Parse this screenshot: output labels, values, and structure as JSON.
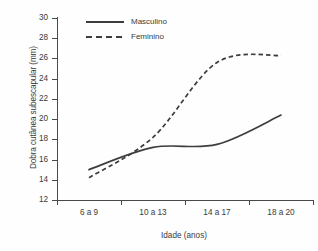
{
  "chart_data": {
    "type": "line",
    "title": "",
    "xlabel": "Idade (anos)",
    "ylabel": "Dobra cutânea subescapular (mm)",
    "categories": [
      "6 a 9",
      "10 a 13",
      "14 a 17",
      "18 a 20"
    ],
    "ylim": [
      12,
      30
    ],
    "ytick_labels": [
      "12",
      "14",
      "16",
      "18",
      "20",
      "22",
      "24",
      "26",
      "28",
      "30"
    ],
    "ytick_values": [
      12,
      14,
      16,
      18,
      20,
      22,
      24,
      26,
      28,
      30
    ],
    "grid": false,
    "legend_position": "top-left-inside",
    "series": [
      {
        "name": "Masculino",
        "style": "solid",
        "color": "#3d3d3d",
        "values": [
          15.0,
          17.2,
          17.5,
          20.4
        ]
      },
      {
        "name": "Feminino",
        "style": "dashed",
        "color": "#3d3d3d",
        "values": [
          14.2,
          18.2,
          25.6,
          26.3
        ]
      }
    ]
  },
  "axes": {
    "y_title": "Dobra cutânea subescapular (mm)",
    "x_title": "Idade (anos)"
  },
  "legend": {
    "entries": [
      {
        "label": "Masculino",
        "style": "solid"
      },
      {
        "label": "Feminino",
        "style": "dashed"
      }
    ]
  },
  "colors": {
    "line": "#3d3d3d",
    "axis": "#4a4a4a",
    "text": "#3a3a3a",
    "background": "#fefefe"
  }
}
